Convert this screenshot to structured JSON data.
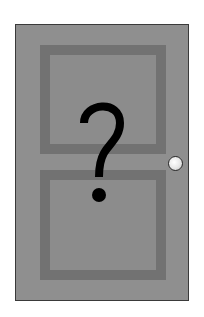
{
  "scene": {
    "subject": "door",
    "symbol": "?",
    "icons": {
      "door": "door-icon",
      "knob": "doorknob-icon",
      "symbol": "question-mark-icon"
    },
    "colors": {
      "background": "#ffffff",
      "door": "#8f8f8f",
      "panel_frame": "#727272",
      "panel_fill": "#8c8c8c",
      "door_outline": "#3a3a3a",
      "knob": "#e6e6e6",
      "symbol": "#000000"
    }
  }
}
